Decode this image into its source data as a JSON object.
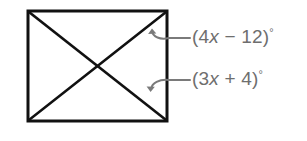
{
  "figure": {
    "kind": "geometry-diagram",
    "shape": "square-with-diagonals",
    "background_color": "#ffffff",
    "stroke_color": "#111111",
    "annotation_color": "#6e6e6e",
    "square": {
      "left": 28,
      "top": 11,
      "right": 167,
      "bottom": 121,
      "stroke_width": 3
    },
    "diagonals": [
      {
        "name": "diagonal-top-left-to-bottom-right",
        "x1": 28,
        "y1": 11,
        "x2": 167,
        "y2": 121
      },
      {
        "name": "diagonal-bottom-left-to-top-right",
        "x1": 28,
        "y1": 121,
        "x2": 167,
        "y2": 11
      }
    ],
    "intersection_point": {
      "x": 98,
      "y": 66
    },
    "annotations": [
      {
        "id": "angle-top",
        "text_prefix": "(4",
        "variable": "x",
        "operator": " − ",
        "constant": "12)",
        "degree": "°",
        "full_text": "(4x − 12)°",
        "leader_line": {
          "x1": 168,
          "y1": 38,
          "x2": 189,
          "y2": 38
        },
        "arrow_target": "upper-right-interior-angle"
      },
      {
        "id": "angle-bottom",
        "text_prefix": "(3",
        "variable": "x",
        "operator": " + ",
        "constant": "4)",
        "degree": "°",
        "full_text": "(3x + 4)°",
        "leader_line": {
          "x1": 168,
          "y1": 80,
          "x2": 189,
          "y2": 80
        },
        "arrow_target": "lower-right-interior-angle"
      }
    ]
  }
}
